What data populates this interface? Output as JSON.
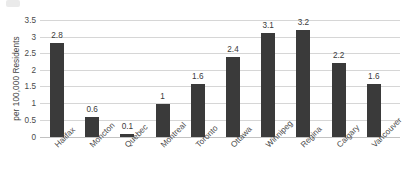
{
  "chart_data": {
    "type": "bar",
    "title": "",
    "xlabel": "",
    "ylabel": "per 100,000 Residents",
    "ylim": [
      0,
      3.5
    ],
    "ytick_step": 0.5,
    "yticks": [
      "0",
      "0.5",
      "1",
      "1.5",
      "2",
      "2.5",
      "3",
      "3.5"
    ],
    "grid": true,
    "legend": "none",
    "bar_color": "#3a3a3a",
    "gridline_color": "#d6d6d6",
    "categories": [
      "Halifax",
      "Moncton",
      "Quebec",
      "Montreal",
      "Toronto",
      "Ottawa",
      "Winnipeg",
      "Regina",
      "Calgary",
      "Vancouver"
    ],
    "values": [
      2.8,
      0.6,
      0.1,
      1,
      1.6,
      2.4,
      3.1,
      3.2,
      2.2,
      1.6
    ],
    "data_labels": [
      "2.8",
      "0.6",
      "0.1",
      "1",
      "1.6",
      "2.4",
      "3.1",
      "3.2",
      "2.2",
      "1.6"
    ]
  }
}
